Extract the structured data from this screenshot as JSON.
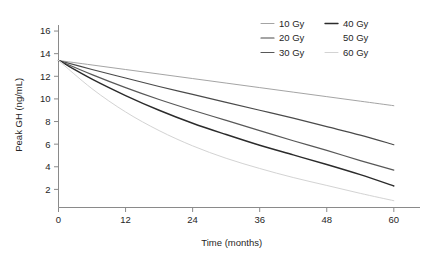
{
  "chart_data": {
    "type": "line",
    "title": "",
    "xlabel": "Time (months)",
    "ylabel": "Peak GH (ng/mL)",
    "xlim": [
      0,
      62
    ],
    "ylim": [
      0.4,
      16.8
    ],
    "xticks": [
      0,
      12,
      24,
      36,
      48,
      60
    ],
    "yticks": [
      2,
      4,
      6,
      8,
      10,
      12,
      14,
      16
    ],
    "xtick_labels": [
      "0",
      "12",
      "24",
      "36",
      "48",
      "60"
    ],
    "ytick_labels": [
      "2",
      "4",
      "6",
      "8",
      "10",
      "12",
      "14",
      "16"
    ],
    "grid": false,
    "legend_position": "top-right",
    "x": [
      0,
      6,
      12,
      18,
      24,
      30,
      36,
      42,
      48,
      54,
      60
    ],
    "series": [
      {
        "name": "10 Gy",
        "label": "10 Gy",
        "color": "#9a9a9a",
        "stroke_width": 0.9,
        "values": [
          13.4,
          13.0,
          12.6,
          12.2,
          11.8,
          11.4,
          11.0,
          10.6,
          10.2,
          9.8,
          9.4
        ]
      },
      {
        "name": "20 Gy",
        "label": "20 Gy",
        "color": "#4a4a4a",
        "stroke_width": 1.2,
        "values": [
          13.4,
          12.6,
          11.85,
          11.1,
          10.4,
          9.7,
          9.0,
          8.3,
          7.55,
          6.8,
          5.95
        ]
      },
      {
        "name": "30 Gy",
        "label": "30 Gy",
        "color": "#585858",
        "stroke_width": 1.2,
        "values": [
          13.4,
          12.15,
          11.0,
          9.95,
          9.0,
          8.1,
          7.2,
          6.3,
          5.45,
          4.55,
          3.7
        ]
      },
      {
        "name": "40 Gy",
        "label": "40 Gy",
        "color": "#2b2b2b",
        "stroke_width": 1.4,
        "values": [
          13.4,
          11.75,
          10.3,
          9.0,
          7.85,
          6.85,
          5.9,
          5.05,
          4.2,
          3.3,
          2.3
        ]
      },
      {
        "name": "50 Gy",
        "label": "50 Gy",
        "color": "#ffffff",
        "stroke_width": 0.9,
        "values": [
          13.4,
          11.3,
          9.6,
          8.15,
          6.95,
          5.9,
          4.95,
          4.1,
          3.3,
          2.5,
          1.7
        ]
      },
      {
        "name": "60 Gy",
        "label": "60 Gy",
        "color": "#d3d3d3",
        "stroke_width": 1.0,
        "values": [
          13.4,
          10.9,
          8.85,
          7.2,
          5.85,
          4.75,
          3.85,
          3.05,
          2.35,
          1.65,
          1.0
        ]
      }
    ]
  },
  "axes": {
    "x_title": "Time (months)",
    "y_title": "Peak GH (ng/mL)",
    "axis_color": "#8a8a8a",
    "text_color": "#262626"
  },
  "legend": {
    "column_left": [
      "10 Gy",
      "20 Gy",
      "30 Gy"
    ],
    "column_right": [
      "40 Gy",
      "50 Gy",
      "60 Gy"
    ]
  }
}
